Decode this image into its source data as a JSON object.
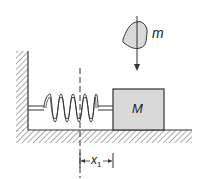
{
  "diagram": {
    "type": "mass-spring system with falling mass",
    "labels": {
      "falling_mass": "m",
      "block_mass": "M",
      "displacement": "x",
      "displacement_sub": "1"
    },
    "colors": {
      "line": "#333333",
      "fill": "#d9d9d9",
      "background": "#ffffff"
    }
  }
}
